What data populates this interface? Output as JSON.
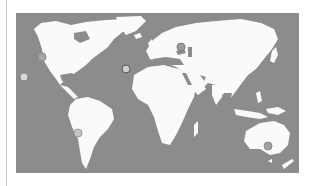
{
  "map": {
    "type": "world-map",
    "style": "grayscale",
    "colors": {
      "ocean": "#8c8c8c",
      "land": "#fafafa",
      "divider": "#c8c8c8"
    }
  },
  "markers": [
    {
      "id": "pacific",
      "x": 24,
      "y": 77,
      "fill": "#d8d8d8",
      "border": "#8a8a8a"
    },
    {
      "id": "us-west-coast",
      "x": 42,
      "y": 57,
      "fill": "#a8a8a8",
      "border": "#8a8a8a"
    },
    {
      "id": "atlantic-canary",
      "x": 126,
      "y": 69,
      "fill": "#cfcfcf",
      "border": "#555555"
    },
    {
      "id": "caucasus",
      "x": 181,
      "y": 47,
      "fill": "#9a9a9a",
      "border": "#7a7a7a"
    },
    {
      "id": "chile",
      "x": 78,
      "y": 133,
      "fill": "#c4c4c4",
      "border": "#9a9a9a"
    },
    {
      "id": "se-australia",
      "x": 268,
      "y": 146,
      "fill": "#a0a0a0",
      "border": "#8a8a8a"
    }
  ]
}
